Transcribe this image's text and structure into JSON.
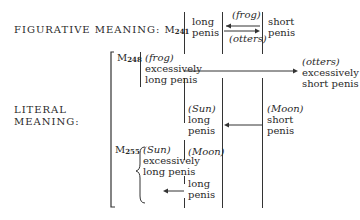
{
  "figurative": {
    "label": "FIGURATIVE MEANING:",
    "myth_prefix": "M",
    "myth_num": "241",
    "left_node": {
      "line1": "long",
      "line2": "penis"
    },
    "arrow_top_label": "(frog)",
    "arrow_bottom_label": "(otters)",
    "right_node": {
      "line1": "short",
      "line2": "penis"
    }
  },
  "literal": {
    "label_line1": "LITERAL",
    "label_line2": "MEANING:",
    "m248": {
      "myth_prefix": "M",
      "myth_num": "248",
      "left": {
        "agent": "(frog)",
        "line1": "excessively",
        "line2": "long penis"
      },
      "right": {
        "agent": "(otters)",
        "line1": "excessively",
        "line2": "short penis"
      }
    },
    "middle": {
      "left": {
        "agent": "(Sun)",
        "line1": "long",
        "line2": "penis"
      },
      "right": {
        "agent": "(Moon)",
        "line1": "short",
        "line2": "penis"
      }
    },
    "m255": {
      "myth_prefix": "M",
      "myth_num": "255",
      "left": {
        "agent": "(Sun)",
        "line1": "excessively",
        "line2": "long penis"
      },
      "right_agent": "(Moon)",
      "bottom": {
        "line1": "long",
        "line2": "penis"
      }
    }
  }
}
